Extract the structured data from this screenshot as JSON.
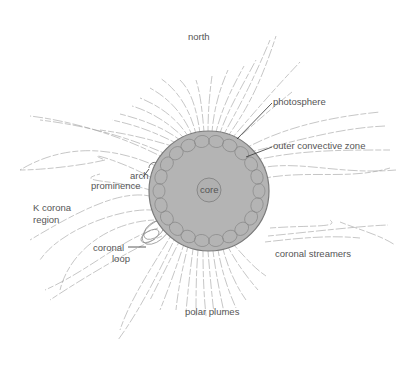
{
  "diagram": {
    "colors": {
      "sun_fill": "#b4b4b4",
      "sun_edge": "#7a7a7a",
      "cell_stroke": "#8a8a8a",
      "line": "#9a9a9a",
      "leader": "#333333",
      "text": "#555555"
    },
    "labels": {
      "north": "north",
      "photosphere": "photosphere",
      "outer_convective_zone": "outer convective zone",
      "arch": "arch",
      "prominence": "prominence",
      "core": "core",
      "k_corona_line1": "K corona",
      "k_corona_line2": "region",
      "coronal_loop_line1": "coronal",
      "coronal_loop_line2": "loop",
      "coronal_streamers": "coronal streamers",
      "polar_plumes": "polar plumes"
    },
    "nodes": [
      {
        "id": "sun",
        "label": "photosphere",
        "shape": "circle"
      },
      {
        "id": "core",
        "label": "core",
        "shape": "circle"
      },
      {
        "id": "convective",
        "label": "outer convective zone",
        "shape": "ring of cells"
      },
      {
        "id": "prominence",
        "label": "arch prominence"
      },
      {
        "id": "loop",
        "label": "coronal loop"
      },
      {
        "id": "kcorona",
        "label": "K corona region"
      },
      {
        "id": "streamers",
        "label": "coronal streamers"
      },
      {
        "id": "plumes",
        "label": "polar plumes"
      },
      {
        "id": "north",
        "label": "north"
      }
    ]
  }
}
